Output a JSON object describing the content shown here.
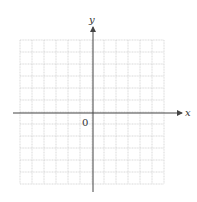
{
  "diagram": {
    "type": "coordinate-grid",
    "grid": {
      "columns": 12,
      "rows": 12,
      "left": 20,
      "top": 40,
      "cell": 12,
      "line_color": "#c8c8c8"
    },
    "axes": {
      "x_label": "x",
      "y_label": "y",
      "origin_label": "0",
      "color": "#444444"
    }
  }
}
